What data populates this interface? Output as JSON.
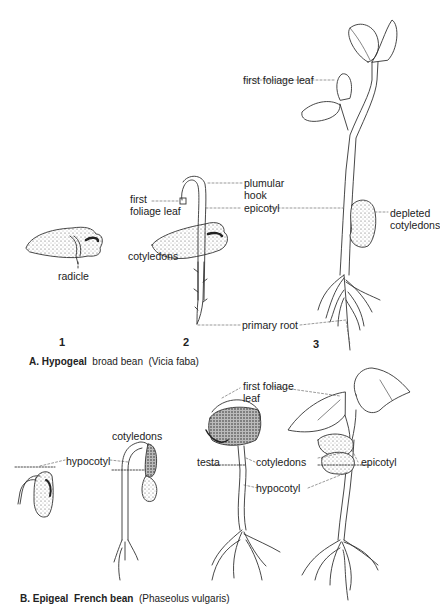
{
  "figure": {
    "sectionA": {
      "caption_prefix": "A. Hypogeal",
      "caption_name": "broad bean",
      "caption_latin": "(Vicia faba)",
      "stages": [
        "1",
        "2",
        "3"
      ],
      "labels": {
        "radicle": "radicle",
        "first_foliage_leaf_2a": "first",
        "first_foliage_leaf_2b": "foliage leaf",
        "plumular_hook_a": "plumular",
        "plumular_hook_b": "hook",
        "epicotyl": "epicotyl",
        "cotyledons": "cotyledons",
        "primary_root": "primary root",
        "first_foliage_leaf_3": "first foliage leaf",
        "depleted_a": "depleted",
        "depleted_b": "cotyledons"
      }
    },
    "sectionB": {
      "caption_prefix": "B. Epigeal",
      "caption_name": "French bean",
      "caption_latin": "(Phaseolus vulgaris)",
      "labels": {
        "hypocotyl_1": "hypocotyl",
        "cotyledons_1": "cotyledons",
        "first_foliage_leaf_a": "first foliage",
        "first_foliage_leaf_b": "leaf",
        "testa": "testa",
        "cotyledons_2": "cotyledons",
        "epicotyl": "epicotyl",
        "hypocotyl_2": "hypocotyl"
      }
    }
  }
}
